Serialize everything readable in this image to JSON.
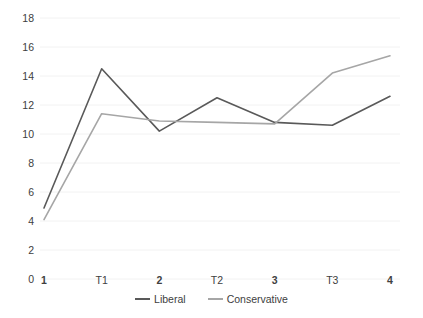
{
  "chart_data": {
    "type": "line",
    "title": "",
    "xlabel": "",
    "ylabel": "",
    "categories": [
      "1",
      "T1",
      "2",
      "T2",
      "3",
      "T3",
      "4"
    ],
    "bold_categories": [
      "1",
      "2",
      "3",
      "4"
    ],
    "series": [
      {
        "name": "Liberal",
        "color": "#595959",
        "values": [
          4.9,
          14.5,
          10.2,
          12.5,
          10.8,
          10.6,
          12.6
        ]
      },
      {
        "name": "Conservative",
        "color": "#a6a6a6",
        "values": [
          4.1,
          11.4,
          10.9,
          10.8,
          10.7,
          14.2,
          15.4
        ]
      }
    ],
    "ylim": [
      0,
      18
    ],
    "yticks": [
      "0",
      "2",
      "4",
      "6",
      "8",
      "10",
      "12",
      "14",
      "16",
      "18"
    ],
    "ytick_values": [
      0,
      2,
      4,
      6,
      8,
      10,
      12,
      14,
      16,
      18
    ],
    "grid": true,
    "grid_axis": "y",
    "grid_color": "#f2f2f2",
    "legend_position": "bottom",
    "background_color": "#ffffff"
  }
}
